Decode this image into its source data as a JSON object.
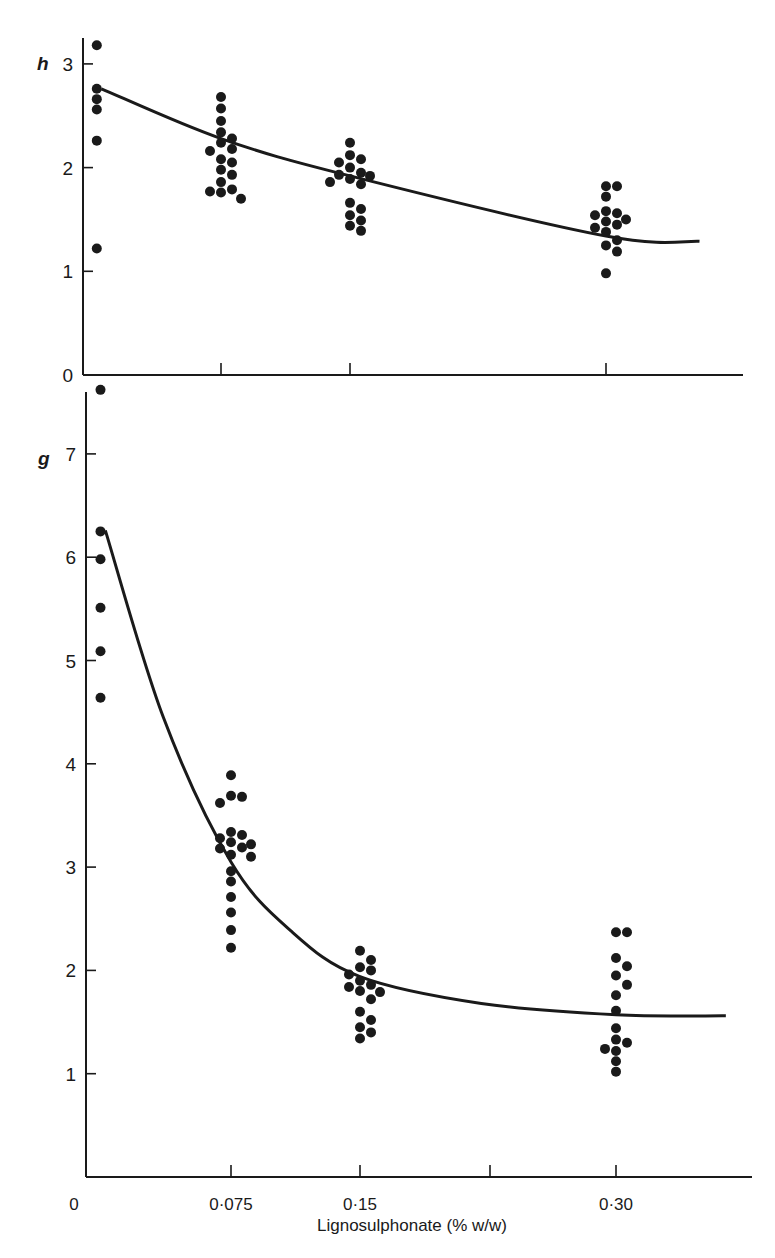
{
  "chart_data": [
    {
      "type": "scatter",
      "panel": "top",
      "title": "",
      "ylabel": "h",
      "xlabel": "",
      "ylim": [
        0,
        3.3
      ],
      "yticks": [
        0,
        1,
        2,
        3
      ],
      "ytick_labels": [
        "0",
        "1",
        "2",
        "3"
      ],
      "xticks": [
        0.075,
        0.15,
        0.3
      ],
      "grid": false,
      "series": [
        {
          "name": "0.0075",
          "x": 0.0075,
          "values": [
            3.18,
            2.76,
            2.66,
            2.56,
            2.26,
            1.22
          ]
        },
        {
          "name": "0.075",
          "x": 0.075,
          "values": [
            2.68,
            2.57,
            2.45,
            2.34,
            2.28,
            2.24,
            2.18,
            2.16,
            2.08,
            2.05,
            1.98,
            1.93,
            1.86,
            1.79,
            1.77,
            1.76,
            1.7
          ]
        },
        {
          "name": "0.15",
          "x": 0.15,
          "values": [
            2.24,
            2.12,
            2.08,
            2.05,
            2.0,
            1.95,
            1.93,
            1.92,
            1.89,
            1.86,
            1.84,
            1.66,
            1.6,
            1.54,
            1.49,
            1.44,
            1.39
          ]
        },
        {
          "name": "0.30",
          "x": 0.3,
          "values": [
            1.82,
            1.82,
            1.72,
            1.58,
            1.56,
            1.54,
            1.5,
            1.48,
            1.45,
            1.42,
            1.38,
            1.3,
            1.25,
            1.19,
            0.98
          ]
        }
      ],
      "fit_curve": {
        "x": [
          0.01,
          0.075,
          0.15,
          0.3,
          0.355
        ],
        "y": [
          2.76,
          2.28,
          1.92,
          1.34,
          1.29
        ]
      }
    },
    {
      "type": "scatter",
      "panel": "bottom",
      "title": "",
      "ylabel": "g",
      "xlabel": "Lignosulphonate (% w/w)",
      "ylim": [
        0,
        7.6
      ],
      "yticks": [
        1,
        2,
        3,
        4,
        5,
        6,
        7
      ],
      "ytick_labels": [
        "1",
        "2",
        "3",
        "4",
        "5",
        "6",
        "7"
      ],
      "xticks": [
        0,
        0.075,
        0.15,
        0.225,
        0.3
      ],
      "xtick_labels": [
        "0",
        "0·075",
        "0·15",
        "",
        "0·30"
      ],
      "grid": false,
      "series": [
        {
          "name": "0.0075",
          "x": 0.0075,
          "values": [
            7.62,
            6.25,
            5.98,
            5.51,
            5.09,
            4.64
          ]
        },
        {
          "name": "0.075",
          "x": 0.075,
          "values": [
            3.89,
            3.69,
            3.68,
            3.62,
            3.34,
            3.31,
            3.28,
            3.24,
            3.22,
            3.19,
            3.18,
            3.12,
            3.1,
            2.96,
            2.86,
            2.71,
            2.56,
            2.39,
            2.22
          ]
        },
        {
          "name": "0.15",
          "x": 0.15,
          "values": [
            2.19,
            2.1,
            2.03,
            2.0,
            1.96,
            1.9,
            1.86,
            1.84,
            1.8,
            1.79,
            1.72,
            1.6,
            1.52,
            1.45,
            1.4,
            1.34
          ]
        },
        {
          "name": "0.30",
          "x": 0.3,
          "values": [
            2.37,
            2.37,
            2.12,
            2.04,
            1.95,
            1.86,
            1.76,
            1.61,
            1.44,
            1.33,
            1.3,
            1.24,
            1.22,
            1.12,
            1.02
          ]
        }
      ],
      "fit_curve": {
        "x": [
          0.01,
          0.04,
          0.075,
          0.11,
          0.15,
          0.22,
          0.3,
          0.365
        ],
        "y": [
          6.26,
          4.45,
          3.05,
          2.38,
          1.94,
          1.68,
          1.57,
          1.56
        ]
      }
    }
  ],
  "labels": {
    "top_ylabel": "h",
    "bottom_ylabel": "g",
    "xlabel": "Lignosulphonate (% w/w)",
    "top_zero": "0",
    "bottom_zero": "0"
  },
  "colors": {
    "ink": "#1a1a1a",
    "background": "#ffffff"
  }
}
